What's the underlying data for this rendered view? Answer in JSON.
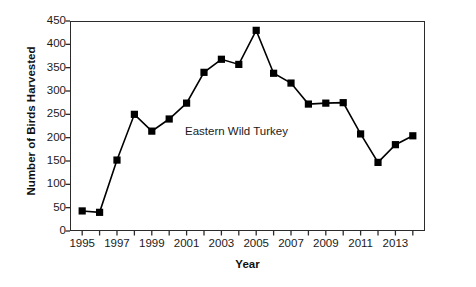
{
  "chart_data": {
    "type": "line",
    "title": "",
    "xlabel": "Year",
    "ylabel": "Number of Birds Harvested",
    "xlim": [
      1994.3,
      2014.7
    ],
    "ylim": [
      0,
      450
    ],
    "grid": false,
    "legend": "none",
    "annotations": [
      "Eastern Wild Turkey"
    ],
    "series": [
      {
        "name": "Eastern Wild Turkey",
        "marker": "square",
        "color": "#000000",
        "x": [
          1995,
          1996,
          1997,
          1998,
          1999,
          2000,
          2001,
          2002,
          2003,
          2004,
          2005,
          2006,
          2007,
          2008,
          2009,
          2010,
          2011,
          2012,
          2013,
          2014
        ],
        "values": [
          43,
          40,
          152,
          250,
          214,
          240,
          274,
          340,
          368,
          357,
          430,
          338,
          317,
          272,
          274,
          275,
          208,
          147,
          185,
          204
        ]
      }
    ],
    "y_ticks": [
      0,
      50,
      100,
      150,
      200,
      250,
      300,
      350,
      400,
      450
    ],
    "y_tick_labels": [
      "0",
      "50",
      "100",
      "150",
      "200",
      "250",
      "300",
      "350",
      "400",
      "450"
    ],
    "x_ticks": [
      1995,
      1996,
      1997,
      1998,
      1999,
      2000,
      2001,
      2002,
      2003,
      2004,
      2005,
      2006,
      2007,
      2008,
      2009,
      2010,
      2011,
      2012,
      2013,
      2014
    ],
    "x_tick_labels_shown": [
      "1995",
      "1997",
      "1999",
      "2001",
      "2003",
      "2005",
      "2007",
      "2009",
      "2011",
      "2013"
    ],
    "x_labeled_values": [
      1995,
      1997,
      1999,
      2001,
      2003,
      2005,
      2007,
      2009,
      2011,
      2013
    ]
  },
  "style": {
    "axis_color": "#2b2b2b",
    "line_color": "#000000",
    "marker_color": "#000000",
    "background": "#ffffff",
    "text_color": "#1a1a1a"
  }
}
